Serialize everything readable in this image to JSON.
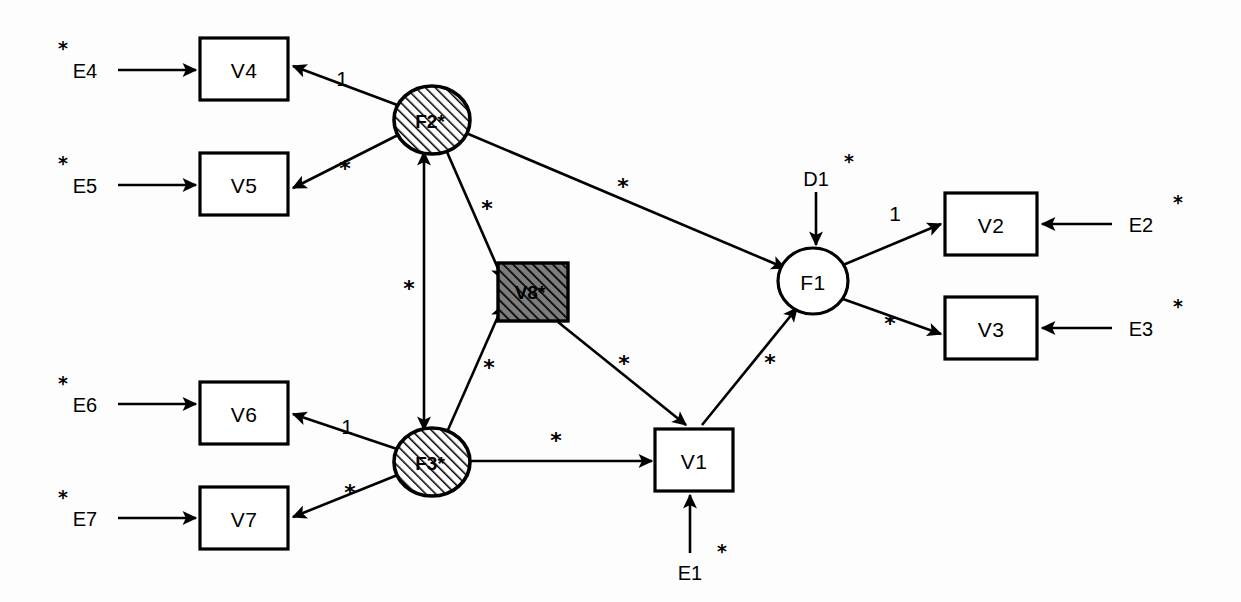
{
  "diagram": {
    "type": "structural-equation-model-path-diagram",
    "title": "",
    "notation": {
      "fixed_marker": "1",
      "free_marker": "*",
      "observed_shape": "rectangle",
      "latent_shape": "ellipse",
      "hatched_meaning": "hatched/shaded node"
    },
    "colors": {
      "stroke": "#000000",
      "node_fill": "#ffffff",
      "hatch": "#000000",
      "hatch_bg_circle": "#ffffff",
      "hatch_bg_square": "#8a8a8a",
      "background": "#fdfdfd"
    },
    "nodes": [
      {
        "id": "V4",
        "label": "V4",
        "shape": "rectangle",
        "fill": "white",
        "x": 244,
        "y": 69,
        "w": 88,
        "h": 62
      },
      {
        "id": "V5",
        "label": "V5",
        "shape": "rectangle",
        "fill": "white",
        "x": 244,
        "y": 184,
        "w": 88,
        "h": 62
      },
      {
        "id": "V6",
        "label": "V6",
        "shape": "rectangle",
        "fill": "white",
        "x": 244,
        "y": 413,
        "w": 88,
        "h": 62
      },
      {
        "id": "V7",
        "label": "V7",
        "shape": "rectangle",
        "fill": "white",
        "x": 244,
        "y": 513,
        "w": 88,
        "h": 62
      },
      {
        "id": "V1",
        "label": "V1",
        "shape": "rectangle",
        "fill": "white",
        "x": 694,
        "y": 460,
        "w": 78,
        "h": 62
      },
      {
        "id": "V2",
        "label": "V2",
        "shape": "rectangle",
        "fill": "white",
        "x": 991,
        "y": 224,
        "w": 92,
        "h": 62
      },
      {
        "id": "V3",
        "label": "V3",
        "shape": "rectangle",
        "fill": "white",
        "x": 991,
        "y": 328,
        "w": 92,
        "h": 62
      },
      {
        "id": "V8",
        "label": "V8*",
        "shape": "rectangle",
        "fill": "hatched",
        "x": 533,
        "y": 292,
        "w": 70,
        "h": 58
      },
      {
        "id": "F2",
        "label": "F2*",
        "shape": "ellipse",
        "fill": "hatched",
        "x": 432,
        "y": 120,
        "rx": 38,
        "ry": 34
      },
      {
        "id": "F3",
        "label": "F3*",
        "shape": "ellipse",
        "fill": "hatched",
        "x": 432,
        "y": 462,
        "rx": 38,
        "ry": 34
      },
      {
        "id": "F1",
        "label": "F1",
        "shape": "ellipse",
        "fill": "white",
        "x": 813,
        "y": 281,
        "rx": 35,
        "ry": 33
      }
    ],
    "residuals": [
      {
        "id": "E4",
        "label": "E4",
        "star": "*",
        "x": 85,
        "y": 70
      },
      {
        "id": "E5",
        "label": "E5",
        "star": "*",
        "x": 85,
        "y": 185
      },
      {
        "id": "E6",
        "label": "E6",
        "star": "*",
        "x": 85,
        "y": 404
      },
      {
        "id": "E7",
        "label": "E7",
        "star": "*",
        "x": 85,
        "y": 518
      },
      {
        "id": "E1",
        "label": "E1",
        "star": "*",
        "x": 690,
        "y": 572
      },
      {
        "id": "E2",
        "label": "E2",
        "star": "*",
        "x": 1141,
        "y": 224
      },
      {
        "id": "E3",
        "label": "E3",
        "star": "*",
        "x": 1141,
        "y": 328
      },
      {
        "id": "D1",
        "label": "D1",
        "star": "*",
        "x": 816,
        "y": 178
      }
    ],
    "paths": [
      {
        "id": "E4-V4",
        "from": "E4",
        "to": "V4",
        "label": "",
        "head": "single"
      },
      {
        "id": "E5-V5",
        "from": "E5",
        "to": "V5",
        "label": "",
        "head": "single"
      },
      {
        "id": "E6-V6",
        "from": "E6",
        "to": "V6",
        "label": "",
        "head": "single"
      },
      {
        "id": "E7-V7",
        "from": "E7",
        "to": "V7",
        "label": "",
        "head": "single"
      },
      {
        "id": "E1-V1",
        "from": "E1",
        "to": "V1",
        "label": "",
        "head": "single"
      },
      {
        "id": "E2-V2",
        "from": "E2",
        "to": "V2",
        "label": "",
        "head": "single"
      },
      {
        "id": "E3-V3",
        "from": "E3",
        "to": "V3",
        "label": "",
        "head": "single"
      },
      {
        "id": "D1-F1",
        "from": "D1",
        "to": "F1",
        "label": "",
        "head": "single"
      },
      {
        "id": "F2-V4",
        "from": "F2",
        "to": "V4",
        "label": "1",
        "head": "single"
      },
      {
        "id": "F2-V5",
        "from": "F2",
        "to": "V5",
        "label": "*",
        "head": "single"
      },
      {
        "id": "F3-V6",
        "from": "F3",
        "to": "V6",
        "label": "1",
        "head": "single"
      },
      {
        "id": "F3-V7",
        "from": "F3",
        "to": "V7",
        "label": "*",
        "head": "single"
      },
      {
        "id": "F2-F3",
        "from": "F2",
        "to": "F3",
        "label": "*",
        "head": "double"
      },
      {
        "id": "F2-V8",
        "from": "F2",
        "to": "V8",
        "label": "*",
        "head": "single"
      },
      {
        "id": "F3-V8",
        "from": "F3",
        "to": "V8",
        "label": "*",
        "head": "single"
      },
      {
        "id": "F2-F1",
        "from": "F2",
        "to": "F1",
        "label": "*",
        "head": "single"
      },
      {
        "id": "V8-V1",
        "from": "V8",
        "to": "V1",
        "label": "*",
        "head": "single"
      },
      {
        "id": "F3-V1",
        "from": "F3",
        "to": "V1",
        "label": "*",
        "head": "single"
      },
      {
        "id": "V1-F1",
        "from": "V1",
        "to": "F1",
        "label": "*",
        "head": "single"
      },
      {
        "id": "F1-V2",
        "from": "F1",
        "to": "V2",
        "label": "1",
        "head": "single"
      },
      {
        "id": "F1-V3",
        "from": "F1",
        "to": "V3",
        "label": "*",
        "head": "single"
      }
    ],
    "path_labels": [
      {
        "id": "lbl-F2-V4",
        "text": "1",
        "x": 342,
        "y": 78
      },
      {
        "id": "lbl-F2-V5",
        "text": "*",
        "x": 345,
        "y": 168
      },
      {
        "id": "lbl-F2-F1",
        "text": "*",
        "x": 623,
        "y": 186
      },
      {
        "id": "lbl-F2-V8",
        "text": "*",
        "x": 487,
        "y": 208
      },
      {
        "id": "lbl-F2-F3",
        "text": "*",
        "x": 409,
        "y": 288
      },
      {
        "id": "lbl-F3-V8",
        "text": "*",
        "x": 489,
        "y": 367
      },
      {
        "id": "lbl-V8-V1",
        "text": "*",
        "x": 624,
        "y": 363
      },
      {
        "id": "lbl-V1-F1",
        "text": "*",
        "x": 770,
        "y": 362
      },
      {
        "id": "lbl-F3-V1",
        "text": "*",
        "x": 556,
        "y": 440
      },
      {
        "id": "lbl-F3-V6",
        "text": "1",
        "x": 347,
        "y": 426
      },
      {
        "id": "lbl-F3-V7",
        "text": "*",
        "x": 350,
        "y": 492
      },
      {
        "id": "lbl-F1-V2",
        "text": "1",
        "x": 895,
        "y": 213
      },
      {
        "id": "lbl-F1-V3",
        "text": "*",
        "x": 890,
        "y": 323
      }
    ]
  }
}
